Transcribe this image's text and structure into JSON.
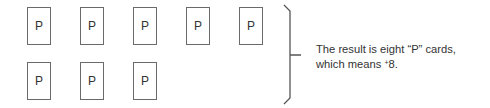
{
  "diagram": {
    "cards": [
      {
        "label": "P",
        "row": 1
      },
      {
        "label": "P",
        "row": 1
      },
      {
        "label": "P",
        "row": 1
      },
      {
        "label": "P",
        "row": 1
      },
      {
        "label": "P",
        "row": 1
      },
      {
        "label": "P",
        "row": 2
      },
      {
        "label": "P",
        "row": 2
      },
      {
        "label": "P",
        "row": 2
      }
    ],
    "caption": {
      "line1": "The result is eight “P” cards,",
      "line2_prefix": "which means ",
      "sign": "+",
      "value": "8",
      "line2_suffix": "."
    },
    "colors": {
      "border": "#6a6a6a",
      "text": "#333333"
    }
  }
}
